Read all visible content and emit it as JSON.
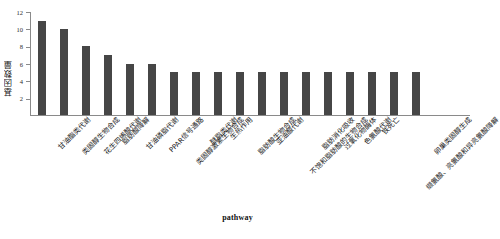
{
  "chart_data": {
    "type": "bar",
    "title": "",
    "xlabel": "pathway",
    "ylabel": "基因数量",
    "ylim": [
      0,
      12
    ],
    "yticks": [
      2,
      4,
      6,
      8,
      10,
      12
    ],
    "grid": false,
    "legend": false,
    "bar_color": "#464646",
    "categories": [
      "甘油酯类代谢",
      "类固醇生物合成",
      "花生四烯酸代谢",
      "脂肪酸降解",
      "甘油磷脂代谢",
      "PPAR信号通路",
      "类固醇激素生物合成",
      "醚脂类代谢",
      "生热作用",
      "脂肪酸生物合成",
      "亚油酸代谢",
      "不饱和脂肪酸的生物合成",
      "脂肪消化吸收",
      "过氧化物酶体",
      "色氨酸代谢",
      "铁死亡",
      "缬氨酸、亮氨酸和异亮氨酸降解",
      "卵巢类固醇生成"
    ],
    "values": [
      11,
      10,
      8,
      7,
      6,
      6,
      5,
      5,
      5,
      5,
      5,
      5,
      5,
      5,
      5,
      5,
      5,
      5
    ],
    "n_bars": 20
  }
}
